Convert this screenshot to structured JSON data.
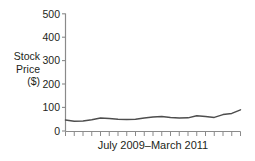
{
  "chart_data": {
    "type": "line",
    "title": "",
    "xlabel": "July 2009–March 2011",
    "ylabel": "Stock Price ($)",
    "ylabel_lines": [
      "Stock",
      "Price",
      "($)"
    ],
    "ylim": [
      0,
      500
    ],
    "yticks": [
      0,
      100,
      200,
      300,
      400,
      500
    ],
    "ytick_labels": [
      "0",
      "100",
      "200",
      "300",
      "400",
      "500"
    ],
    "xlim": [
      0,
      20
    ],
    "xticks": [
      0,
      1,
      2,
      3,
      4,
      5,
      6,
      7,
      8,
      9,
      10,
      11,
      12,
      13,
      14,
      15,
      16,
      17,
      18,
      19,
      20
    ],
    "xtick_labels": [
      "",
      "",
      "",
      "",
      "",
      "",
      "",
      "",
      "",
      "",
      "",
      "",
      "",
      "",
      "",
      "",
      "",
      "",
      "",
      "",
      ""
    ],
    "grid": false,
    "legend": false,
    "legend_position": "none",
    "series": [
      {
        "name": "Stock Price",
        "color": "#4d4d4d",
        "x": [
          0,
          1,
          2,
          3,
          4,
          5,
          6,
          7,
          8,
          9,
          10,
          11,
          12,
          13,
          14,
          15,
          16,
          17,
          18,
          19,
          20
        ],
        "values": [
          47,
          42,
          43,
          48,
          55,
          53,
          50,
          49,
          50,
          55,
          60,
          62,
          58,
          55,
          56,
          65,
          62,
          58,
          70,
          75,
          90
        ]
      }
    ],
    "annotations": []
  },
  "axis": {
    "y_tick_labels": [
      "500",
      "400",
      "300",
      "200",
      "100",
      "0"
    ],
    "x_axis_label": "July 2009–March 2011",
    "y_axis_label_lines": [
      "Stock",
      "Price",
      "($)"
    ]
  },
  "colors": {
    "line": "#4d4d4d",
    "axis": "#808080",
    "text": "#231f20",
    "background": "#ffffff"
  }
}
